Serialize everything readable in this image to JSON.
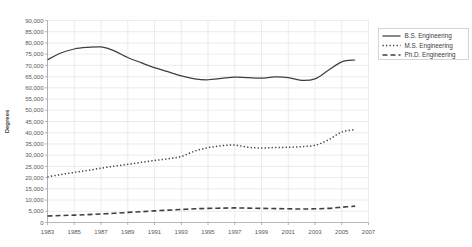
{
  "chart_data": {
    "type": "line",
    "title": "",
    "xlabel": "",
    "ylabel": "Degrees",
    "xlim": [
      1983,
      2007
    ],
    "ylim": [
      0,
      90000
    ],
    "grid": true,
    "legend_position": "right",
    "x_tick_labels": [
      "1983",
      "1985",
      "1987",
      "1989",
      "1991",
      "1993",
      "1995",
      "1997",
      "1999",
      "2001",
      "2003",
      "2005",
      "2007"
    ],
    "y_tick_labels": [
      "0",
      "5,000",
      "10,000",
      "15,000",
      "20,000",
      "25,000",
      "30,000",
      "35,000",
      "40,000",
      "45,000",
      "50,000",
      "55,000",
      "60,000",
      "65,000",
      "70,000",
      "75,000",
      "80,000",
      "85,000",
      "90,000"
    ],
    "y_tick_values": [
      0,
      5000,
      10000,
      15000,
      20000,
      25000,
      30000,
      35000,
      40000,
      45000,
      50000,
      55000,
      60000,
      65000,
      70000,
      75000,
      80000,
      85000,
      90000
    ],
    "x": [
      1983,
      1984,
      1985,
      1986,
      1987,
      1988,
      1989,
      1990,
      1991,
      1992,
      1993,
      1994,
      1995,
      1996,
      1997,
      1998,
      1999,
      2000,
      2001,
      2002,
      2003,
      2004,
      2005,
      2006
    ],
    "series": [
      {
        "name": "B.S. Engineering",
        "style": "solid",
        "color": "#3f3f3f",
        "values": [
          72500,
          75500,
          77300,
          78000,
          78200,
          76500,
          73500,
          71200,
          69000,
          67200,
          65300,
          64000,
          63600,
          64200,
          64800,
          64500,
          64300,
          64900,
          64600,
          63300,
          64000,
          67800,
          71600,
          72400
        ]
      },
      {
        "name": "M.S. Engineering",
        "style": "dotted",
        "color": "#3f3f3f",
        "values": [
          20300,
          21400,
          22300,
          23200,
          24200,
          25100,
          25900,
          26800,
          27600,
          28400,
          29400,
          31800,
          33300,
          34200,
          34500,
          33500,
          33200,
          33400,
          33500,
          33800,
          34400,
          36800,
          40300,
          41400
        ]
      },
      {
        "name": "Ph.D. Engineering",
        "style": "dashed",
        "color": "#3f3f3f",
        "values": [
          2900,
          3100,
          3300,
          3500,
          3800,
          4100,
          4500,
          4800,
          5200,
          5500,
          5800,
          6100,
          6300,
          6400,
          6500,
          6400,
          6300,
          6200,
          6100,
          6000,
          6100,
          6300,
          6800,
          7300
        ]
      }
    ]
  },
  "legend": {
    "items": [
      {
        "label": "B.S. Engineering",
        "style": "solid"
      },
      {
        "label": "M.S. Engineering",
        "style": "dotted"
      },
      {
        "label": "Ph.D. Engineering",
        "style": "dashed"
      }
    ]
  }
}
